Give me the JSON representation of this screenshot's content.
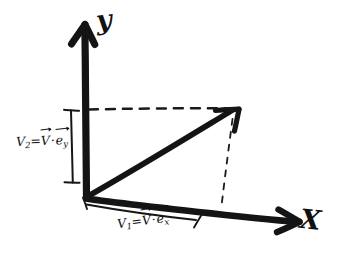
{
  "figure": {
    "kind": "hand-drawn-sketch",
    "background_color": "#ffffff",
    "ink_color": "#111111"
  },
  "axes": {
    "y": {
      "label": "y",
      "name": "y-axis",
      "direction": "up",
      "arrowhead": true
    },
    "x": {
      "label": "X",
      "name": "x-axis",
      "direction": "down-right",
      "arrowhead": true
    }
  },
  "vector": {
    "name": "vector-v",
    "description": "thick arrow from origin to upper right",
    "arrowhead": true
  },
  "projections": {
    "horizontal_guide": {
      "name": "horizontal-dashed-guide",
      "style": "dashed",
      "description": "dashed line from y-axis level of vector tip across to the vector tip"
    },
    "vertical_guide": {
      "name": "vertical-dashed-guide",
      "style": "dashed",
      "description": "dashed line from vector tip down to the x-axis"
    }
  },
  "measurements": [
    {
      "id": "v2",
      "name": "y-component-bracket",
      "orientation": "vertical",
      "label_plain": "V2 = V . e_y",
      "component": "V",
      "component_subscript": "2",
      "equals": "=",
      "vector_symbol": "V",
      "dot": "·",
      "basis_symbol": "e",
      "basis_subscript": "y"
    },
    {
      "id": "v1",
      "name": "x-component-bracket",
      "orientation": "horizontal",
      "label_plain": "V1 = V . e_x",
      "component": "V",
      "component_subscript": "1",
      "equals": "=",
      "vector_symbol": "V",
      "dot": "·",
      "basis_symbol": "e",
      "basis_subscript": "x"
    }
  ]
}
